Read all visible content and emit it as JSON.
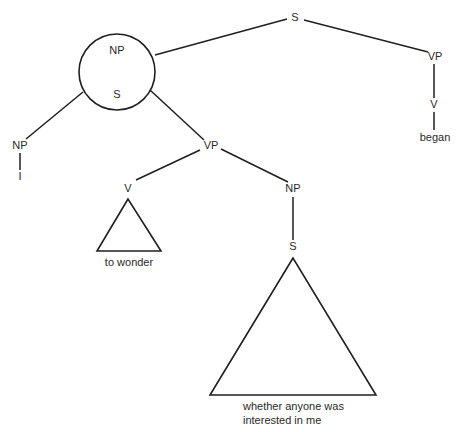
{
  "diagram": {
    "type": "syntax-tree",
    "nodes": {
      "root_s": "S",
      "circle_np": "NP",
      "circle_s": "S",
      "top_vp": "VP",
      "top_v": "V",
      "top_v_word": "began",
      "subj_np": "NP",
      "subj_word": "I",
      "inner_vp": "VP",
      "inner_v": "V",
      "inner_v_phrase": "to wonder",
      "obj_np": "NP",
      "obj_s": "S",
      "obj_phrase_line1": "whether anyone was",
      "obj_phrase_line2": "interested in me"
    },
    "edges": [
      [
        "S",
        "NP(circled)"
      ],
      [
        "S",
        "VP"
      ],
      [
        "VP",
        "V"
      ],
      [
        "V",
        "began"
      ],
      [
        "NP(circled)",
        "S(circled)"
      ],
      [
        "S(circled)",
        "NP"
      ],
      [
        "S(circled)",
        "VP"
      ],
      [
        "NP",
        "I"
      ],
      [
        "VP",
        "V"
      ],
      [
        "V",
        "to wonder (triangle)"
      ],
      [
        "VP",
        "NP"
      ],
      [
        "NP",
        "S"
      ],
      [
        "S",
        "whether anyone was interested in me (triangle)"
      ]
    ]
  }
}
